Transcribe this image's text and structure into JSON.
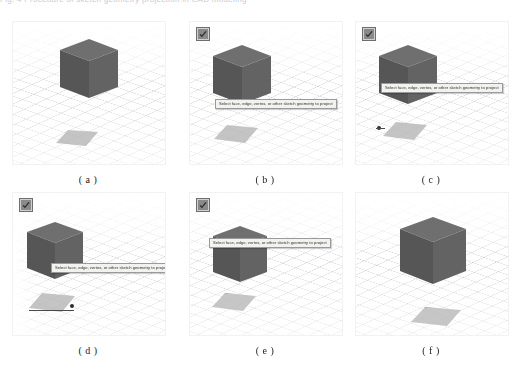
{
  "figure": {
    "top_clipped_text": "Fig. 4  Procedure of sketch geometry projection in CAD modeling",
    "columns": 3,
    "rows": 2
  },
  "tooltip_text": "Select face, edge, vertex, or other sketch geometry to project",
  "confirm_button_label": "OK",
  "icons": {
    "check": "check-icon"
  },
  "colors": {
    "cube_top": "#6f6f6f",
    "cube_left": "#565656",
    "cube_right": "#636363",
    "cube_edge": "#3e3e3e",
    "sketch_fill": "#b0b0b0",
    "grid_line": "#96a0af",
    "tooltip_bg": "#f2f2ef",
    "tooltip_border": "#9a9a9a",
    "button_bg": "#8a8a8a",
    "viewport_bg": "#ffffff"
  },
  "panels": [
    {
      "id": "a",
      "caption": "( a )",
      "has_confirm_button": false,
      "has_tooltip": false,
      "has_sketch_point": false,
      "description": "Isometric view of gray cube on grid plane with projected sketch square below"
    },
    {
      "id": "b",
      "caption": "( b )",
      "has_confirm_button": true,
      "has_tooltip": true,
      "has_sketch_point": false,
      "description": "Project command active, selection prompt tooltip below cube"
    },
    {
      "id": "c",
      "caption": "( c )",
      "has_confirm_button": true,
      "has_tooltip": true,
      "has_sketch_point": true,
      "description": "Tooltip overlapping cube, sketch square shows selected vertex point"
    },
    {
      "id": "d",
      "caption": "( d )",
      "has_confirm_button": true,
      "has_tooltip": true,
      "has_sketch_point": true,
      "description": "Tooltip at cube lower edge, sketch square with highlighted corner point"
    },
    {
      "id": "e",
      "caption": "( e )",
      "has_confirm_button": true,
      "has_tooltip": true,
      "has_sketch_point": false,
      "description": "Tooltip crossing cube top face, outlined sketch square below"
    },
    {
      "id": "f",
      "caption": "( f )",
      "has_confirm_button": false,
      "has_tooltip": false,
      "has_sketch_point": false,
      "description": "Final result, enlarged cube with completed projected sketch square"
    }
  ]
}
